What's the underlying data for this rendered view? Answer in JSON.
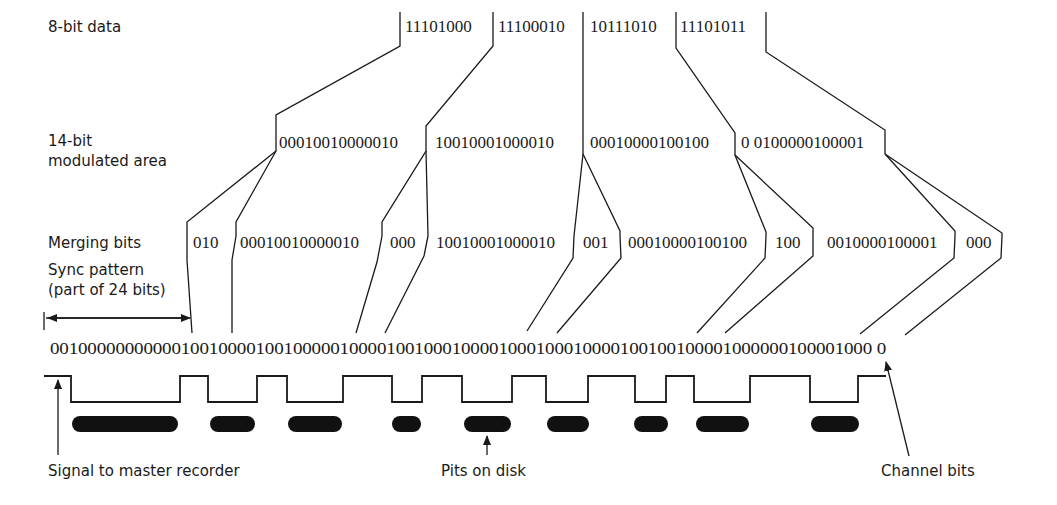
{
  "colors": {
    "ink": "#1a1a1a",
    "pit": "#111111",
    "background": "#ffffff"
  },
  "rows": {
    "data8": {
      "label": "8-bit data",
      "values": [
        "11101000",
        "11100010",
        "10111010",
        "11101011"
      ]
    },
    "data14": {
      "label_line1": "14-bit",
      "label_line2": "modulated area",
      "values": [
        "00010010000010",
        "10010001000010",
        "00010000100100",
        "0 0100000100001"
      ]
    },
    "merging": {
      "label": "Merging bits",
      "values": [
        "010",
        "00010010000010",
        "000",
        "10010001000010",
        "001",
        "00010000100100",
        "100",
        "0010000100001",
        "000"
      ]
    },
    "sync": {
      "label_line1": "Sync pattern",
      "label_line2": "(part of 24 bits)"
    },
    "channel": {
      "bits": "0010000000000010010000100100000100001001000100001000100010000100100100001000000100001000 0"
    }
  },
  "annotations": {
    "signal": "Signal to master recorder",
    "pits": "Pits on disk",
    "channel_bits": "Channel bits"
  }
}
